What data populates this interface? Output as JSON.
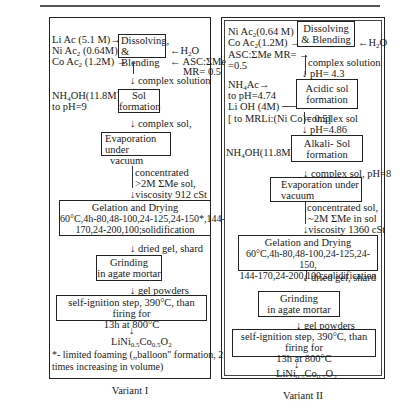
{
  "variant1": {
    "caption": "Variant I",
    "inputs": {
      "li_ac": "Li Ac (5.1 M)→",
      "ni_ac": "Ni Ac",
      "ni_ac_rest": " (0.64M)→",
      "co_ac": "Co Ac",
      "co_ac_rest": " (1.2M) →",
      "h2o": "←H",
      "h2o_rest": "O",
      "asc": "← ASC:ΣMe",
      "mr": "MR= 0.5"
    },
    "steps": {
      "dissolving_line1": "Dissolving,",
      "dissolving_line2": "& Blending",
      "complex_solution": "↓ complex solution",
      "nh4oh": "NH",
      "nh4oh_rest": "OH(11.8M)→",
      "to_ph": "to pH=9",
      "sol_line1": "Sol",
      "sol_line2": "formation",
      "complex_sol": "↓ complex sol,",
      "evap_line1": "Evaporation under",
      "evap_line2": "vacuum",
      "concentrated": "concentrated",
      "conc_me": ">2M ΣMe sol,",
      "viscosity": "↓viscosity 912 cSt",
      "gel_title": "Gelation and Drying",
      "gel_line1": "60°C,4h-80,48-100,24-125,24-150*,144-",
      "gel_line2": "170,24-200,100;solidification",
      "dried_gel": "↓ dried gel, shard",
      "grind_line1": "Grinding",
      "grind_line2": "in agate mortar",
      "gel_powders": "↓ gel powders",
      "ignite_line1": "self-ignition step, 390°C, than firing for",
      "ignite_line2": "13h at 800°C",
      "arrow": "↓",
      "product_li": "LiNi",
      "product_ni_sub": "0.5",
      "product_co": "Co",
      "product_co_sub": "0.5",
      "product_o": "O",
      "product_o_sub": "2",
      "footnote_line1": "*- limited foaming („balloon\" formation, 2",
      "footnote_line2": "times increasing in volume)"
    }
  },
  "variant2": {
    "caption": "Variant II",
    "inputs": {
      "ni_ac": "Ni Ac",
      "ni_ac_rest": "(0.64 M) →",
      "co_ac": "Co Ac",
      "co_ac_rest": "(1.2M)  →",
      "asc": "ASC:ΣMe MR= →",
      "asc2": "=0.5",
      "h2o": "←H",
      "h2o_rest": "O",
      "nh4ac": "NH",
      "nh4ac_rest": "Ac→",
      "to_ph": "to pH=4.74",
      "lioh": "Li OH (4M)  ──→",
      "mr_li": "[ to MRLi:(Ni Co)= 0.5]"
    },
    "steps": {
      "dissolving_line1": "Dissolving",
      "dissolving_line2": "& Blending",
      "complex_solution": "complex solution",
      "ph1": "↓ pH= 4.3",
      "acidic_line1": "Acidic sol",
      "acidic_line2": "formation",
      "complex_sol": "complex sol",
      "ph2": "↓ pH=4.86",
      "nh4oh": "NH",
      "nh4oh_rest": "OH(11.8M)→",
      "alkali_line1": "Alkali- Sol",
      "alkali_line2": "formation",
      "complex_sol_ph": "↓ complex sol, pH=8",
      "evap_line1": "Evaporation under",
      "evap_line2": "vacuum",
      "concentrated": "concentrated sol,",
      "conc_me": "~2M ΣMe in sol",
      "viscosity": "↓viscosity 1360 cSt",
      "gel_title": "Gelation and Drying",
      "gel_line1": "60°C,4h-80,48-100,24-125,24-150,",
      "gel_line2": "144-170,24-200,100;solidification",
      "dried_gel": "↓ dried gel, shard",
      "grind_line1": "Grinding",
      "grind_line2": "in agate mortar",
      "gel_powders": "↓ gel powders",
      "ignite_line1": "self-ignition step, 390°C, than firing for",
      "ignite_line2": "13h at 800°C",
      "arrow": "↓",
      "product_li": "LiNi",
      "product_ni_sub": "0.5",
      "product_co": "Co",
      "product_co_sub": "0.5",
      "product_o": "O",
      "product_o_sub": "2"
    }
  },
  "subscripts": {
    "two": "2",
    "four": "4"
  }
}
